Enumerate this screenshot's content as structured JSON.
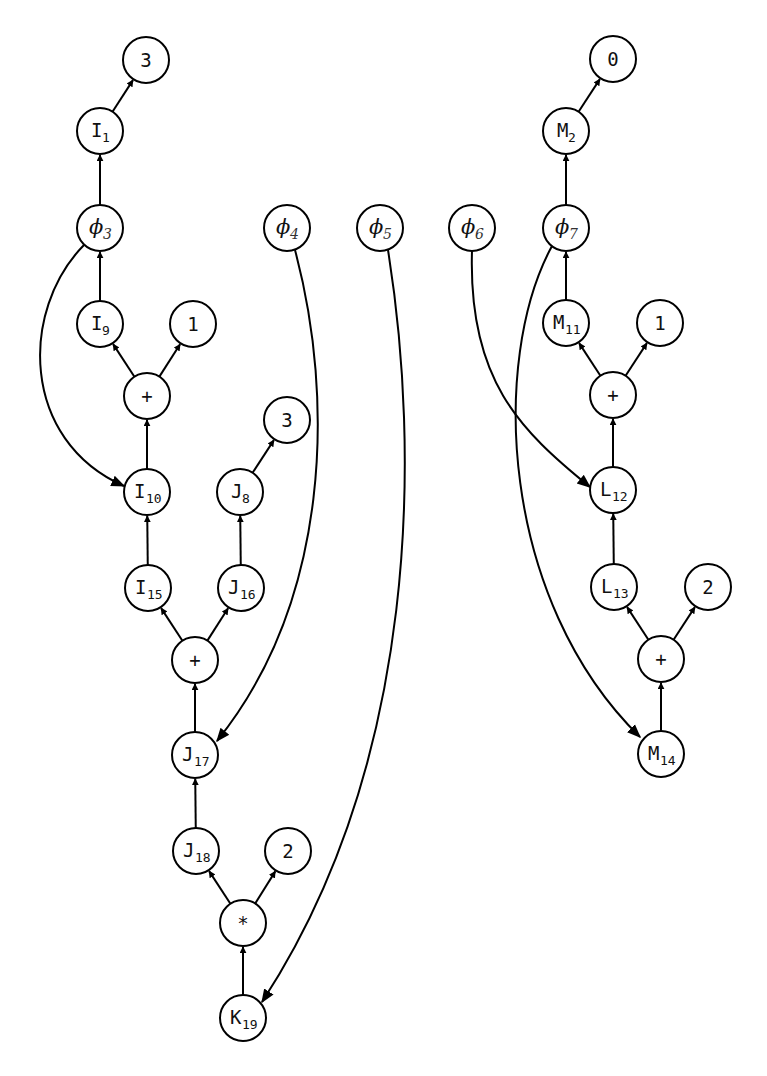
{
  "diagram": {
    "type": "dataflow-graph",
    "node_radius": 23,
    "nodes": [
      {
        "id": "c3a",
        "label": "3",
        "sub": "",
        "kind": "const",
        "x": 146,
        "y": 60
      },
      {
        "id": "I1",
        "label": "I",
        "sub": "1",
        "kind": "var",
        "x": 100,
        "y": 131
      },
      {
        "id": "phi3",
        "label": "ϕ",
        "sub": "3",
        "kind": "phi",
        "x": 100,
        "y": 228
      },
      {
        "id": "I9",
        "label": "I",
        "sub": "9",
        "kind": "var",
        "x": 100,
        "y": 324
      },
      {
        "id": "c1a",
        "label": "1",
        "sub": "",
        "kind": "const",
        "x": 193,
        "y": 324
      },
      {
        "id": "plus1",
        "label": "+",
        "sub": "",
        "kind": "op",
        "x": 147,
        "y": 396
      },
      {
        "id": "I10",
        "label": "I",
        "sub": "10",
        "kind": "var",
        "x": 147,
        "y": 492
      },
      {
        "id": "c3b",
        "label": "3",
        "sub": "",
        "kind": "const",
        "x": 287,
        "y": 420
      },
      {
        "id": "J8",
        "label": "J",
        "sub": "8",
        "kind": "var",
        "x": 240,
        "y": 492
      },
      {
        "id": "I15",
        "label": "I",
        "sub": "15",
        "kind": "var",
        "x": 148,
        "y": 588
      },
      {
        "id": "J16",
        "label": "J",
        "sub": "16",
        "kind": "var",
        "x": 241,
        "y": 588
      },
      {
        "id": "plus2",
        "label": "+",
        "sub": "",
        "kind": "op",
        "x": 195,
        "y": 660
      },
      {
        "id": "J17",
        "label": "J",
        "sub": "17",
        "kind": "var",
        "x": 195,
        "y": 755
      },
      {
        "id": "J18",
        "label": "J",
        "sub": "18",
        "kind": "var",
        "x": 196,
        "y": 851
      },
      {
        "id": "c2a",
        "label": "2",
        "sub": "",
        "kind": "const",
        "x": 288,
        "y": 851
      },
      {
        "id": "mul",
        "label": "*",
        "sub": "",
        "kind": "op",
        "x": 243,
        "y": 923
      },
      {
        "id": "K19",
        "label": "K",
        "sub": "19",
        "kind": "var",
        "x": 243,
        "y": 1018
      },
      {
        "id": "phi4",
        "label": "ϕ",
        "sub": "4",
        "kind": "phi",
        "x": 287,
        "y": 228
      },
      {
        "id": "phi5",
        "label": "ϕ",
        "sub": "5",
        "kind": "phi",
        "x": 380,
        "y": 228
      },
      {
        "id": "phi6",
        "label": "ϕ",
        "sub": "6",
        "kind": "phi",
        "x": 472,
        "y": 228
      },
      {
        "id": "c0",
        "label": "0",
        "sub": "",
        "kind": "const",
        "x": 613,
        "y": 59
      },
      {
        "id": "M2",
        "label": "M",
        "sub": "2",
        "kind": "var",
        "x": 566,
        "y": 131
      },
      {
        "id": "phi7",
        "label": "ϕ",
        "sub": "7",
        "kind": "phi",
        "x": 566,
        "y": 228
      },
      {
        "id": "M11",
        "label": "M",
        "sub": "11",
        "kind": "var",
        "x": 566,
        "y": 323
      },
      {
        "id": "c1b",
        "label": "1",
        "sub": "",
        "kind": "const",
        "x": 660,
        "y": 323
      },
      {
        "id": "plus3",
        "label": "+",
        "sub": "",
        "kind": "op",
        "x": 613,
        "y": 395
      },
      {
        "id": "L12",
        "label": "L",
        "sub": "12",
        "kind": "var",
        "x": 613,
        "y": 490
      },
      {
        "id": "L13",
        "label": "L",
        "sub": "13",
        "kind": "var",
        "x": 614,
        "y": 587
      },
      {
        "id": "c2b",
        "label": "2",
        "sub": "",
        "kind": "const",
        "x": 708,
        "y": 587
      },
      {
        "id": "plus4",
        "label": "+",
        "sub": "",
        "kind": "op",
        "x": 661,
        "y": 659
      },
      {
        "id": "M14",
        "label": "M",
        "sub": "14",
        "kind": "var",
        "x": 661,
        "y": 754
      }
    ],
    "edges": [
      {
        "from": "I1",
        "to": "c3a"
      },
      {
        "from": "phi3",
        "to": "I1"
      },
      {
        "from": "I9",
        "to": "phi3"
      },
      {
        "from": "plus1",
        "to": "I9"
      },
      {
        "from": "plus1",
        "to": "c1a"
      },
      {
        "from": "I10",
        "to": "plus1"
      },
      {
        "from": "phi3",
        "to": "I10",
        "curve": "M 84 245 C 20 310, 20 440, 124 486"
      },
      {
        "from": "J8",
        "to": "c3b"
      },
      {
        "from": "I15",
        "to": "I10"
      },
      {
        "from": "J16",
        "to": "J8"
      },
      {
        "from": "plus2",
        "to": "I15"
      },
      {
        "from": "plus2",
        "to": "J16"
      },
      {
        "from": "J17",
        "to": "plus2"
      },
      {
        "from": "phi4",
        "to": "J17",
        "curve": "M 295 250 C 335 400, 330 600, 217 741"
      },
      {
        "from": "J18",
        "to": "J17"
      },
      {
        "from": "mul",
        "to": "J18"
      },
      {
        "from": "mul",
        "to": "c2a"
      },
      {
        "from": "K19",
        "to": "mul"
      },
      {
        "from": "phi5",
        "to": "K19",
        "curve": "M 388 250 C 420 450, 420 760, 262 1002"
      },
      {
        "from": "M2",
        "to": "c0"
      },
      {
        "from": "phi7",
        "to": "M2"
      },
      {
        "from": "M11",
        "to": "phi7"
      },
      {
        "from": "plus3",
        "to": "M11"
      },
      {
        "from": "plus3",
        "to": "c1b"
      },
      {
        "from": "L12",
        "to": "plus3"
      },
      {
        "from": "phi6",
        "to": "L12",
        "curve": "M 472 251 C 468 380, 520 430, 590 487"
      },
      {
        "from": "L13",
        "to": "L12"
      },
      {
        "from": "plus4",
        "to": "L13"
      },
      {
        "from": "plus4",
        "to": "c2b"
      },
      {
        "from": "M14",
        "to": "plus4"
      },
      {
        "from": "phi7",
        "to": "M14",
        "curve": "M 552 246 C 490 360, 500 600, 640 737"
      }
    ]
  }
}
